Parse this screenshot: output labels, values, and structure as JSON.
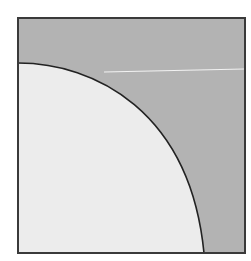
{
  "diagram": {
    "canvas": {
      "width": 251,
      "height": 261,
      "background": "#ffffff"
    },
    "square": {
      "x": 18,
      "y": 18,
      "width": 227,
      "height": 235,
      "fill": "#b3b3b3",
      "stroke": "#3a3a3a",
      "stroke_width": 2
    },
    "arc_region": {
      "start": {
        "x": 18,
        "y": 63
      },
      "end": {
        "x": 204,
        "y": 253
      },
      "fill": "#ececec",
      "stroke": "#222222",
      "stroke_width": 1.6
    },
    "highlight_line": {
      "x1": 104,
      "y1": 72,
      "x2": 244,
      "y2": 69,
      "stroke": "#f2f2f2",
      "stroke_width": 1.2
    },
    "colors": {
      "shaded_region": "#b3b3b3",
      "inner_region": "#ececec",
      "border": "#3a3a3a",
      "arc": "#222222"
    }
  }
}
